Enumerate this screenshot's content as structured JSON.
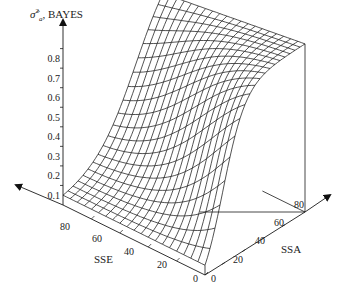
{
  "chart_data": {
    "type": "surface3d",
    "title": "",
    "zlabel": "σ̂²ₐ, BAYES",
    "xlabel": "SSE",
    "ylabel": "SSA",
    "z_ticks": [
      "0.1",
      "0.2",
      "0.3",
      "0.4",
      "0.5",
      "0.6",
      "0.7",
      "0.8"
    ],
    "x_ticks": [
      "0",
      "20",
      "40",
      "60",
      "80"
    ],
    "y_ticks": [
      "0",
      "20",
      "40",
      "60",
      "80"
    ],
    "zlim": [
      0,
      0.9
    ],
    "xlim": [
      0,
      100
    ],
    "ylim": [
      0,
      100
    ],
    "grid_resolution": {
      "sse_lines": 21,
      "ssa_lines": 21
    },
    "surface_description": "Posterior Bayes estimate of sigma_a^2 as a function of SSE and SSA: near 0.05 at SSA=0 across SSE; rises with SSA; for small SSE rises steeply to about 0.85 at SSA=100, for large SSE rises gradually with a saddle/valley at intermediate SSE.",
    "sample_points": [
      {
        "SSE": 0,
        "SSA": 0,
        "z": 0.05
      },
      {
        "SSE": 0,
        "SSA": 100,
        "z": 0.85
      },
      {
        "SSE": 100,
        "SSA": 0,
        "z": 0.05
      },
      {
        "SSE": 100,
        "SSA": 100,
        "z": 0.75
      },
      {
        "SSE": 50,
        "SSA": 50,
        "z": 0.3
      }
    ]
  },
  "labels": {
    "zaxis": "BAYES",
    "zaxis_symbol": "σ̂",
    "zaxis_sup": "2",
    "zaxis_sub": "a",
    "sse": "SSE",
    "ssa": "SSA"
  },
  "ticks": {
    "z": [
      "0.8",
      "0.7",
      "0.6",
      "0.5",
      "0.4",
      "0.3",
      "0.2",
      "0.1"
    ],
    "sse": [
      "80",
      "60",
      "40",
      "20",
      "0"
    ],
    "ssa": [
      "0",
      "20",
      "40",
      "60",
      "80"
    ]
  },
  "colors": {
    "line": "#1a1a1a",
    "background": "#ffffff"
  }
}
